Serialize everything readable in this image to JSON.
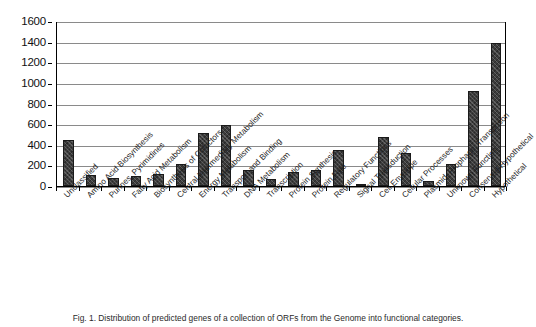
{
  "chart_data": {
    "type": "bar",
    "title": "",
    "xlabel": "",
    "ylabel": "",
    "ylim": [
      0,
      1600
    ],
    "ytick_step": 200,
    "grid": true,
    "legend": "none",
    "yticks": [
      1600,
      1400,
      1200,
      1000,
      800,
      600,
      400,
      200,
      0
    ],
    "categories": [
      "Unclassified",
      "Amino Acid Biosynthesis",
      "Purines, Pyrimidines",
      "Fatty Acid Metabolism",
      "Biosynthesis of Cofactors",
      "Central Intermediary Metabolism",
      "Energy Metabolism",
      "Transport and Binding",
      "DNA Metabolism",
      "Transcription",
      "Protein Synthesis",
      "Protein Fate",
      "Regulatory Functions",
      "Signal Transduction",
      "Cell Envelope",
      "Cellular Processes",
      "Plasmid, Prophage, Transposon",
      "Unknown Function",
      "Conserved Hypothetical",
      "Hypothetical"
    ],
    "values": [
      450,
      105,
      80,
      95,
      115,
      215,
      515,
      595,
      160,
      65,
      135,
      160,
      350,
      10,
      480,
      320,
      45,
      210,
      925,
      1390
    ],
    "bar_color": "#3c3c3c",
    "bar_pattern": "crosshatch",
    "gridline_color": "#8a8a8a",
    "axis_color": "#000000"
  },
  "figure": {
    "caption": "Fig. 1. Distribution of predicted genes of a collection of ORFs from the Genome into functional categories."
  }
}
